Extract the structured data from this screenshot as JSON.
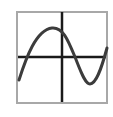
{
  "icon": {
    "name": "sine-wave-graph-icon",
    "frame_color": "#a8a8a8",
    "axis_color": "#1a1a1a",
    "curve_color": "#3c3c3c",
    "background": "#ffffff"
  }
}
